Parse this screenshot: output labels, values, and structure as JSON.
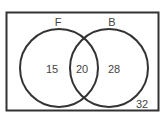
{
  "diagram": {
    "type": "venn",
    "sets": [
      {
        "label": "F"
      },
      {
        "label": "B"
      }
    ],
    "regions": {
      "only_F": "15",
      "F_and_B": "20",
      "only_B": "28",
      "outside": "32"
    }
  }
}
